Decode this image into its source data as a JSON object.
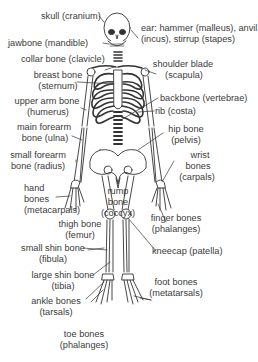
{
  "diagram": {
    "colors": {
      "ink": "#333333",
      "background": "#ffffff"
    },
    "labels": {
      "skull": "skull (cranium)",
      "ear_1": "ear: hammer (malleus), anvil",
      "ear_2": "(incus), stirrup (stapes)",
      "jawbone": "jawbone (mandible)",
      "collar": "collar bone (clavicle)",
      "shoulder_1": "shoulder blade",
      "shoulder_2": "(scapula)",
      "breast_1": "breast bone",
      "breast_2": "(sternum)",
      "upperarm_1": "upper arm bone",
      "upperarm_2": "(humerus)",
      "backbone": "backbone (vertebrae)",
      "rib": "rib (costa)",
      "ulna_1": "main forearm",
      "ulna_2": "bone (ulna)",
      "hip_1": "hip bone",
      "hip_2": "(pelvis)",
      "radius_1": "small forearm",
      "radius_2": "bone (radius)",
      "wrist_1": "wrist",
      "wrist_2": "bones",
      "wrist_3": "(carpals)",
      "hand_1": "hand",
      "hand_2": "bones",
      "hand_3": "(metacarpals)",
      "rump_1": "rump",
      "rump_2": "bone",
      "rump_3": "(coccyx)",
      "finger_1": "finger bones",
      "finger_2": "(phalanges)",
      "thigh_1": "thigh bone",
      "thigh_2": "(femur)",
      "kneecap": "kneecap (patella)",
      "fibula_1": "small shin bone",
      "fibula_2": "(fibula)",
      "tibia_1": "large shin bone",
      "tibia_2": "(tibia)",
      "foot_1": "foot bones",
      "foot_2": "(metatarsals)",
      "ankle_1": "ankle bones",
      "ankle_2": "(tarsals)",
      "toe_1": "toe bones",
      "toe_2": "(phalanges)"
    }
  }
}
